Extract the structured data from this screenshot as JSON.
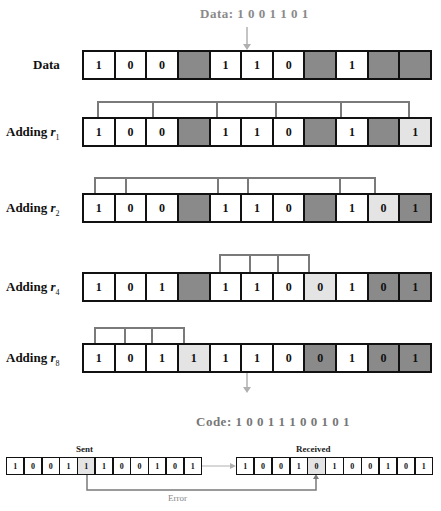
{
  "title": {
    "label": "Data:",
    "bits": "1 0 0 1 1 0 1"
  },
  "rows": [
    {
      "label": "Data",
      "sub": "",
      "cells": [
        {
          "v": "1",
          "s": "empty"
        },
        {
          "v": "0",
          "s": "empty"
        },
        {
          "v": "0",
          "s": "empty"
        },
        {
          "v": "",
          "s": "dark"
        },
        {
          "v": "1",
          "s": "empty"
        },
        {
          "v": "1",
          "s": "empty"
        },
        {
          "v": "0",
          "s": "empty"
        },
        {
          "v": "",
          "s": "dark"
        },
        {
          "v": "1",
          "s": "empty"
        },
        {
          "v": "",
          "s": "dark"
        },
        {
          "v": "",
          "s": "dark"
        }
      ]
    },
    {
      "label": "Adding ",
      "var": "r",
      "sub": "1",
      "cells": [
        {
          "v": "1",
          "s": "empty"
        },
        {
          "v": "0",
          "s": "empty"
        },
        {
          "v": "0",
          "s": "empty"
        },
        {
          "v": "",
          "s": "dark"
        },
        {
          "v": "1",
          "s": "empty"
        },
        {
          "v": "1",
          "s": "empty"
        },
        {
          "v": "0",
          "s": "empty"
        },
        {
          "v": "",
          "s": "dark"
        },
        {
          "v": "1",
          "s": "empty"
        },
        {
          "v": "",
          "s": "dark"
        },
        {
          "v": "1",
          "s": "light"
        }
      ]
    },
    {
      "label": "Adding ",
      "var": "r",
      "sub": "2",
      "cells": [
        {
          "v": "1",
          "s": "empty"
        },
        {
          "v": "0",
          "s": "empty"
        },
        {
          "v": "0",
          "s": "empty"
        },
        {
          "v": "",
          "s": "dark"
        },
        {
          "v": "1",
          "s": "empty"
        },
        {
          "v": "1",
          "s": "empty"
        },
        {
          "v": "0",
          "s": "empty"
        },
        {
          "v": "",
          "s": "dark"
        },
        {
          "v": "1",
          "s": "empty"
        },
        {
          "v": "0",
          "s": "light"
        },
        {
          "v": "1",
          "s": "dark"
        }
      ]
    },
    {
      "label": "Adding ",
      "var": "r",
      "sub": "4",
      "cells": [
        {
          "v": "1",
          "s": "empty"
        },
        {
          "v": "0",
          "s": "empty"
        },
        {
          "v": "1",
          "s": "empty"
        },
        {
          "v": "",
          "s": "dark"
        },
        {
          "v": "1",
          "s": "empty"
        },
        {
          "v": "1",
          "s": "empty"
        },
        {
          "v": "0",
          "s": "empty"
        },
        {
          "v": "0",
          "s": "light"
        },
        {
          "v": "1",
          "s": "empty"
        },
        {
          "v": "0",
          "s": "dark"
        },
        {
          "v": "1",
          "s": "dark"
        }
      ]
    },
    {
      "label": "Adding ",
      "var": "r",
      "sub": "8",
      "cells": [
        {
          "v": "1",
          "s": "empty"
        },
        {
          "v": "0",
          "s": "empty"
        },
        {
          "v": "1",
          "s": "empty"
        },
        {
          "v": "1",
          "s": "light"
        },
        {
          "v": "1",
          "s": "empty"
        },
        {
          "v": "1",
          "s": "empty"
        },
        {
          "v": "0",
          "s": "empty"
        },
        {
          "v": "0",
          "s": "dark"
        },
        {
          "v": "1",
          "s": "empty"
        },
        {
          "v": "0",
          "s": "dark"
        },
        {
          "v": "1",
          "s": "dark"
        }
      ]
    }
  ],
  "code": {
    "label": "Code:",
    "bits": "1 0 0 1 1 1 0 0 1 0 1"
  },
  "sent": {
    "label": "Sent",
    "cells": [
      {
        "v": "1",
        "s": "empty"
      },
      {
        "v": "0",
        "s": "empty"
      },
      {
        "v": "0",
        "s": "empty"
      },
      {
        "v": "1",
        "s": "empty"
      },
      {
        "v": "1",
        "s": "light"
      },
      {
        "v": "1",
        "s": "empty"
      },
      {
        "v": "0",
        "s": "empty"
      },
      {
        "v": "0",
        "s": "empty"
      },
      {
        "v": "1",
        "s": "empty"
      },
      {
        "v": "0",
        "s": "empty"
      },
      {
        "v": "1",
        "s": "empty"
      }
    ]
  },
  "received": {
    "label": "Received",
    "cells": [
      {
        "v": "1",
        "s": "empty"
      },
      {
        "v": "0",
        "s": "empty"
      },
      {
        "v": "0",
        "s": "empty"
      },
      {
        "v": "1",
        "s": "empty"
      },
      {
        "v": "0",
        "s": "light"
      },
      {
        "v": "1",
        "s": "empty"
      },
      {
        "v": "0",
        "s": "empty"
      },
      {
        "v": "0",
        "s": "empty"
      },
      {
        "v": "1",
        "s": "empty"
      },
      {
        "v": "0",
        "s": "empty"
      },
      {
        "v": "1",
        "s": "empty"
      }
    ]
  },
  "error_label": "Error",
  "colors": {
    "dark_cell": "#8a8a8a",
    "light_cell": "#e4e4e4",
    "bracket": "#7a7a7a",
    "arrow": "#b0b0b0"
  }
}
